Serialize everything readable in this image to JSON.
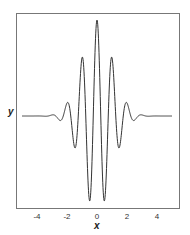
{
  "chart_data": {
    "type": "line",
    "title": "",
    "xlabel": "x",
    "ylabel": "y",
    "function": "y = exp(-x^2/2) * cos(2*pi*x)",
    "xlim": [
      -5,
      5
    ],
    "ylim": [
      -1,
      1
    ],
    "x_ticks": [
      -4,
      -2,
      0,
      2,
      4
    ],
    "x_tick_labels": [
      "-4",
      "-2",
      "0",
      "2",
      "4"
    ],
    "y_ticks": [],
    "grid": false,
    "legend": null,
    "line_color": "#333333",
    "frame_color": "#777777",
    "series": [
      {
        "name": "y",
        "x": [
          -5,
          -4.5,
          -4,
          -3.5,
          -3,
          -2.75,
          -2.5,
          -2.25,
          -2,
          -1.75,
          -1.5,
          -1.25,
          -1,
          -0.75,
          -0.5,
          -0.25,
          0,
          0.25,
          0.5,
          0.75,
          1,
          1.25,
          1.5,
          1.75,
          2,
          2.25,
          2.5,
          2.75,
          3,
          3.5,
          4,
          4.5,
          5
        ],
        "values": [
          0.0,
          -0.0,
          0.0003,
          -0.0022,
          0.0111,
          0.0,
          -0.0439,
          0.0,
          0.1353,
          0.0,
          -0.3247,
          0.0,
          0.6065,
          0.0,
          -0.8825,
          0.0,
          1.0,
          0.0,
          -0.8825,
          0.0,
          0.6065,
          0.0,
          -0.3247,
          0.0,
          0.1353,
          0.0,
          -0.0439,
          0.0,
          0.0111,
          -0.0022,
          0.0003,
          -0.0,
          0.0
        ]
      }
    ]
  },
  "plot": {
    "ylabel": "y",
    "xlabel": "x",
    "ticks": [
      {
        "value": -4,
        "label": "-4"
      },
      {
        "value": -2,
        "label": "-2"
      },
      {
        "value": 0,
        "label": "0"
      },
      {
        "value": 2,
        "label": "2"
      },
      {
        "value": 4,
        "label": "4"
      }
    ]
  }
}
